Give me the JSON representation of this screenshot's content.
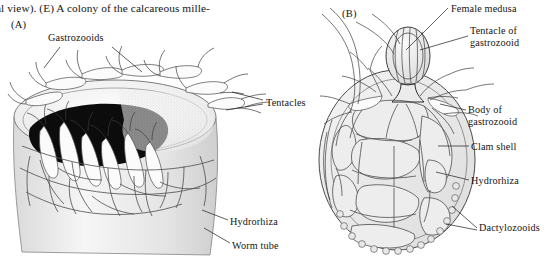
{
  "figure": {
    "caption_fragment": "al view). (E) A colony of the calcareous mille-",
    "panels": [
      {
        "letter": "(A)",
        "name": "hydroid-colony-on-worm-tube"
      },
      {
        "letter": "(B)",
        "name": "hydroid-colony-on-clam-shell"
      }
    ]
  },
  "panel_a": {
    "letter": "(A)",
    "labels": [
      {
        "id": "gastrozooids",
        "text": "Gastrozooids"
      },
      {
        "id": "tentacles",
        "text": "Tentacles"
      },
      {
        "id": "hydrorhiza",
        "text": "Hydrorhiza"
      },
      {
        "id": "worm_tube",
        "text": "Worm tube"
      }
    ]
  },
  "panel_b": {
    "letter": "(B)",
    "labels": [
      {
        "id": "female_medusa",
        "text": "Female medusa"
      },
      {
        "id": "tentacle_of_gastrozooid",
        "text": "Tentacle of\ngastrozooid"
      },
      {
        "id": "body_of_gastrozooid",
        "text": "Body of\ngastrozooid"
      },
      {
        "id": "clam_shell",
        "text": "Clam shell"
      },
      {
        "id": "hydrorhiza",
        "text": "Hydrorhiza"
      },
      {
        "id": "dactylozooids",
        "text": "Dactylozooids"
      }
    ]
  },
  "colors": {
    "background": "#ffffff",
    "ink": "#1a1a1a",
    "line": "#3b3b3b",
    "void": "#0c0c0c",
    "fill": "#ededed"
  }
}
